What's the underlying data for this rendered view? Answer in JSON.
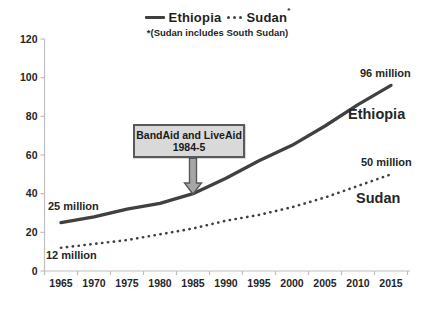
{
  "legend": {
    "ethiopia_label": "Ethiopia",
    "sudan_label": "Sudan",
    "sudan_asterisk": "*",
    "footnote": "*(Sudan includes South Sudan)"
  },
  "annotations": {
    "callout_line1": "BandAid and LiveAid",
    "callout_line2": "1984-5",
    "ethiopia_start_value": "25 million",
    "sudan_start_value": "12 million",
    "ethiopia_end_value": "96 million",
    "sudan_end_value": "50 million",
    "ethiopia_series_label": "Ethiopia",
    "sudan_series_label": "Sudan"
  },
  "colors": {
    "line": "#404040",
    "axis": "#bfbfbf",
    "tick_text": "#262626",
    "callout_fill": "#d9d9d9",
    "callout_border": "#595959",
    "arrow_fill": "#a6a6a6"
  },
  "chart_data": {
    "type": "line",
    "x": [
      1965,
      1970,
      1975,
      1980,
      1985,
      1990,
      1995,
      2000,
      2005,
      2010,
      2015
    ],
    "series": [
      {
        "name": "Ethiopia",
        "style": "solid",
        "values": [
          25,
          28,
          32,
          35,
          40,
          48,
          57,
          65,
          75,
          86,
          96
        ]
      },
      {
        "name": "Sudan",
        "style": "dotted",
        "values": [
          12,
          14,
          16,
          19,
          22,
          26,
          29,
          33,
          38,
          44,
          50
        ]
      }
    ],
    "ylim": [
      0,
      120
    ],
    "yticks": [
      0,
      20,
      40,
      60,
      80,
      100,
      120
    ],
    "xlabel": "",
    "ylabel": "",
    "grid": false,
    "legend_position": "top",
    "footnote": "*(Sudan includes South Sudan)",
    "annotation": {
      "text": "BandAid and LiveAid 1984-5",
      "points_to_year": 1985,
      "points_to_series": "Ethiopia"
    }
  }
}
